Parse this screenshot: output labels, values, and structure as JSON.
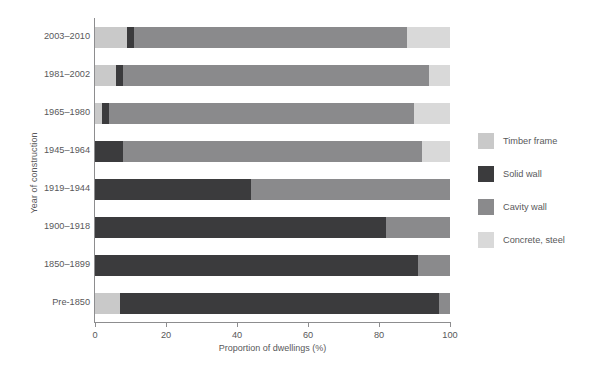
{
  "chart_data": {
    "type": "bar",
    "orientation": "horizontal",
    "stacked": true,
    "title": "",
    "xlabel": "Proportion of dwellings (%)",
    "ylabel": "Year of construction",
    "xlim": [
      0,
      100
    ],
    "xticks": [
      0,
      20,
      40,
      60,
      80,
      100
    ],
    "xtick_labels": [
      "0",
      "20",
      "40",
      "60",
      "80",
      "100"
    ],
    "grid": false,
    "legend_position": "right",
    "categories": [
      "2003–2010",
      "1981–2002",
      "1965–1980",
      "1945–1964",
      "1919–1944",
      "1900–1918",
      "1850–1899",
      "Pre-1850"
    ],
    "series": [
      {
        "name": "Timber frame",
        "color": "#c9c9c9",
        "values": [
          9,
          6,
          2,
          0,
          0,
          0,
          0,
          7
        ]
      },
      {
        "name": "Solid wall",
        "color": "#3b3b3d",
        "values": [
          2,
          2,
          2,
          8,
          44,
          82,
          91,
          90
        ]
      },
      {
        "name": "Cavity wall",
        "color": "#8a8a8c",
        "values": [
          77,
          86,
          86,
          84,
          56,
          18,
          9,
          3
        ]
      },
      {
        "name": "Concrete, steel",
        "color": "#d9d9d9",
        "values": [
          12,
          6,
          10,
          8,
          0,
          0,
          0,
          0
        ]
      }
    ]
  },
  "legend": {
    "items": [
      {
        "label": "Timber frame",
        "color": "#c9c9c9"
      },
      {
        "label": "Solid wall",
        "color": "#3b3b3d"
      },
      {
        "label": "Cavity wall",
        "color": "#8a8a8c"
      },
      {
        "label": "Concrete, steel",
        "color": "#d9d9d9"
      }
    ]
  },
  "axes": {
    "x_title": "Proportion of dwellings (%)",
    "y_title": "Year of construction"
  },
  "colors": {
    "axis": "#8d8d8f",
    "text": "#58585a",
    "background": "#ffffff"
  }
}
